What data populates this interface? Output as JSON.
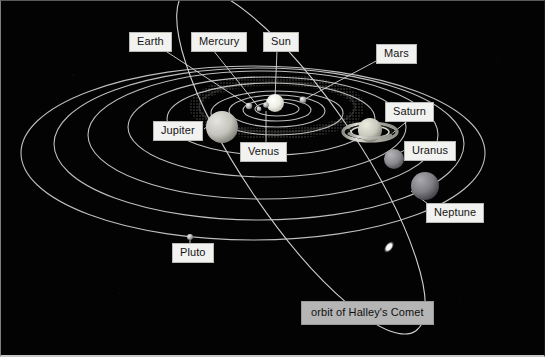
{
  "diagram": {
    "background_color": "#030303",
    "orbit_stroke_color": "#c8c8c8",
    "label_background": "#f2f2f0",
    "label_text_color": "#141414",
    "comet_label_background": "#b5b5b5"
  },
  "labels": [
    {
      "id": "earth",
      "text": "Earth",
      "x": 128,
      "y": 31,
      "leader": {
        "x1": 163,
        "y1": 48,
        "x2": 249,
        "y2": 105
      }
    },
    {
      "id": "mercury",
      "text": "Mercury",
      "x": 190,
      "y": 31,
      "leader": {
        "x1": 212,
        "y1": 48,
        "x2": 258,
        "y2": 107
      }
    },
    {
      "id": "sun",
      "text": "Sun",
      "x": 262,
      "y": 31,
      "leader": {
        "x1": 276,
        "y1": 48,
        "x2": 274,
        "y2": 99
      }
    },
    {
      "id": "mars",
      "text": "Mars",
      "x": 375,
      "y": 43,
      "leader": {
        "x1": 376,
        "y1": 59,
        "x2": 303,
        "y2": 98
      }
    },
    {
      "id": "jupiter",
      "text": "Jupiter",
      "x": 152,
      "y": 120,
      "leader": {
        "x1": 199,
        "y1": 120,
        "x2": 213,
        "y2": 112
      }
    },
    {
      "id": "venus",
      "text": "Venus",
      "x": 239,
      "y": 141,
      "leader": {
        "x1": 265,
        "y1": 141,
        "x2": 265,
        "y2": 110
      }
    },
    {
      "id": "saturn",
      "text": "Saturn",
      "x": 384,
      "y": 101,
      "leader": {
        "x1": 408,
        "y1": 117,
        "x2": 382,
        "y2": 140
      }
    },
    {
      "id": "uranus",
      "text": "Uranus",
      "x": 403,
      "y": 140,
      "leader": {
        "x1": 404,
        "y1": 156,
        "x2": 386,
        "y2": 161
      }
    },
    {
      "id": "neptune",
      "text": "Neptune",
      "x": 425,
      "y": 202,
      "leader": {
        "x1": 425,
        "y1": 206,
        "x2": 404,
        "y2": 182
      }
    },
    {
      "id": "pluto",
      "text": "Pluto",
      "x": 171,
      "y": 242,
      "leader": {
        "x1": 189,
        "y1": 242,
        "x2": 189,
        "y2": 237
      }
    }
  ],
  "comet_label": {
    "id": "halleys-comet",
    "text": "orbit of Halley's Comet",
    "x": 300,
    "y": 300
  },
  "bodies": [
    {
      "id": "sun",
      "name": "Sun",
      "cx": 274,
      "cy": 102,
      "r": 9,
      "color": "#f0f0ea"
    },
    {
      "id": "mercury",
      "name": "Mercury",
      "cx": 258,
      "cy": 108,
      "r": 2.5,
      "color": "#9a9a9a"
    },
    {
      "id": "venus",
      "name": "Venus",
      "cx": 265,
      "cy": 105,
      "r": 2.8,
      "color": "#b3b3b3"
    },
    {
      "id": "earth",
      "name": "Earth",
      "cx": 248,
      "cy": 105,
      "r": 3.2,
      "color": "#a8a8a8"
    },
    {
      "id": "mars",
      "name": "Mars",
      "cx": 302,
      "cy": 99,
      "r": 3.4,
      "color": "#c0c0c0"
    },
    {
      "id": "jupiter",
      "name": "Jupiter",
      "cx": 221,
      "cy": 126,
      "r": 16,
      "color": "#c8c8c4"
    },
    {
      "id": "saturn",
      "name": "Saturn",
      "cx": 369,
      "cy": 131,
      "r": 12,
      "color": "#cfcfc9"
    },
    {
      "id": "uranus",
      "name": "Uranus",
      "cx": 393,
      "cy": 158,
      "r": 10,
      "color": "#8e8e90"
    },
    {
      "id": "neptune",
      "name": "Neptune",
      "cx": 424,
      "cy": 185,
      "r": 14,
      "color": "#7e7e82"
    },
    {
      "id": "pluto",
      "name": "Pluto",
      "cx": 189,
      "cy": 236,
      "r": 3,
      "color": "#bdbdbd"
    },
    {
      "id": "comet",
      "name": "Halley's Comet",
      "cx": 388,
      "cy": 246,
      "r": 5,
      "color": "#ffffff"
    }
  ],
  "orbits": [
    {
      "id": "orbit-mercury",
      "cx": 276,
      "cy": 108,
      "rx": 22,
      "ry": 7
    },
    {
      "id": "orbit-venus",
      "cx": 276,
      "cy": 109,
      "rx": 34,
      "ry": 11
    },
    {
      "id": "orbit-earth",
      "cx": 276,
      "cy": 110,
      "rx": 48,
      "ry": 16
    },
    {
      "id": "orbit-mars",
      "cx": 276,
      "cy": 112,
      "rx": 66,
      "ry": 22
    },
    {
      "id": "orbit-jupiter",
      "cx": 270,
      "cy": 118,
      "rx": 104,
      "ry": 36
    },
    {
      "id": "orbit-saturn",
      "cx": 266,
      "cy": 126,
      "rx": 139,
      "ry": 50
    },
    {
      "id": "orbit-uranus",
      "cx": 262,
      "cy": 134,
      "rx": 175,
      "ry": 64
    },
    {
      "id": "orbit-neptune",
      "cx": 258,
      "cy": 143,
      "rx": 205,
      "ry": 76
    },
    {
      "id": "orbit-pluto",
      "cx": 252,
      "cy": 152,
      "rx": 232,
      "ry": 87
    }
  ],
  "comet_orbit": {
    "id": "orbit-halleys-comet",
    "cx": 300,
    "cy": 160,
    "rx": 58,
    "ry": 205,
    "rotation": -34
  },
  "asteroid_belt": {
    "id": "asteroid-belt",
    "cx": 276,
    "cy": 108,
    "rx": 78,
    "ry": 26,
    "thickness": 9
  }
}
